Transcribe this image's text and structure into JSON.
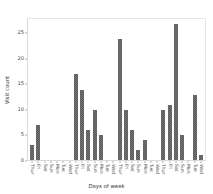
{
  "chart_data": {
    "type": "bar",
    "title": "",
    "xlabel": "Days of week",
    "ylabel": "Visit count",
    "ylim": [
      0,
      28
    ],
    "yticks": [
      0,
      5,
      10,
      15,
      20,
      25
    ],
    "ytick_labels": [
      "0",
      "5",
      "10",
      "15",
      "20",
      "25"
    ],
    "grid": false,
    "legend": null,
    "bar_color": "#595959",
    "background_color": "#ffffff",
    "axis_color": "#d9d9d9",
    "tick_label_color": "#4d4d4d",
    "xtick_rotation": 90,
    "categories": [
      "Thur",
      "Fri",
      "Sat",
      "Sun",
      "Mon",
      "Tue",
      "Wed",
      "Thur",
      "Fri",
      "Sat",
      "Sun",
      "Mon",
      "Tue",
      "Wed",
      "Thur",
      "Fri",
      "Sat",
      "Sun",
      "Mon",
      "Tue",
      "Wed",
      "Thur",
      "Fri",
      "Sat",
      "Sun",
      "Mon",
      "Tue",
      "Wed"
    ],
    "values": [
      3,
      7,
      0,
      0,
      0,
      0,
      0,
      17,
      14,
      6,
      10,
      5,
      0,
      0,
      24,
      10,
      6,
      2,
      4,
      0,
      0,
      10,
      11,
      27,
      5,
      0,
      13,
      1
    ]
  }
}
